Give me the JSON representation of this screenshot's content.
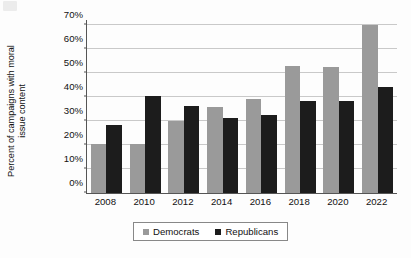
{
  "chart_data": {
    "type": "bar",
    "title": "",
    "xlabel": "",
    "ylabel": "Percent of campaigns with moral issue content",
    "ylabel_lines": [
      "Percent of campaigns with moral",
      "issue content"
    ],
    "categories": [
      "2008",
      "2010",
      "2012",
      "2014",
      "2016",
      "2018",
      "2020",
      "2022"
    ],
    "series": [
      {
        "name": "Democrats",
        "color": "#9a9a9a",
        "values": [
          20.5,
          20.3,
          29.8,
          36.0,
          39.0,
          53.0,
          52.3,
          70.0
        ]
      },
      {
        "name": "Republicans",
        "color": "#1c1c1c",
        "values": [
          28.2,
          40.5,
          36.4,
          31.2,
          32.4,
          38.5,
          38.1,
          44.2
        ]
      }
    ],
    "ylim": [
      0,
      72
    ],
    "ytick_values": [
      0,
      10,
      20,
      30,
      40,
      50,
      60,
      70
    ],
    "ytick_labels": [
      "0%",
      "10%",
      "20%",
      "30%",
      "40%",
      "50%",
      "60%",
      "70%"
    ],
    "grid": true,
    "legend_position": "bottom-center"
  }
}
